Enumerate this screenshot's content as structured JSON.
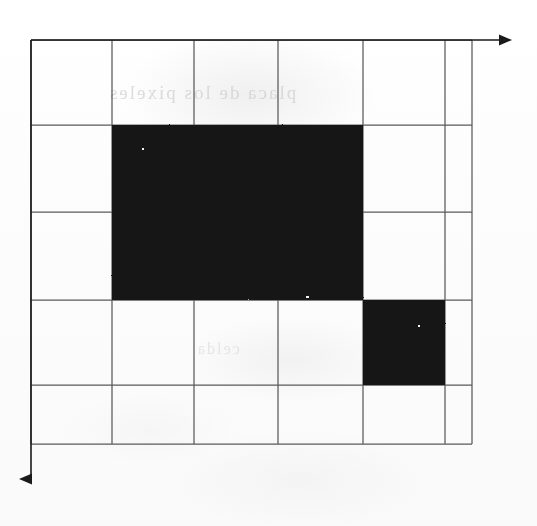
{
  "figure": {
    "title": "",
    "background_color": "#fdfdfd",
    "ink_color": "#111111",
    "grid_line_color": "#555555",
    "axis_color": "#1a1a1a"
  },
  "grid": {
    "columns": 6,
    "rows": 5,
    "x_lines": [
      31,
      112,
      194,
      278,
      363,
      445,
      472
    ],
    "y_lines": [
      40,
      125,
      212,
      300,
      385,
      444
    ],
    "cell_width": 82,
    "cell_height": 86,
    "last_column_narrow": true
  },
  "axes": {
    "x_axis": {
      "name": "horizontal-axis",
      "direction": "right",
      "start_x": 31,
      "end_x": 513,
      "y": 40,
      "arrowhead": true
    },
    "y_axis": {
      "name": "vertical-axis",
      "direction": "down",
      "x": 31,
      "start_y": 40,
      "end_y": 492,
      "arrowhead": true
    }
  },
  "shapes": [
    {
      "name": "large-filled-rectangle",
      "type": "rect",
      "fill": "#111111",
      "x": 112,
      "y": 125,
      "width": 251,
      "height": 175,
      "grid_span": {
        "col_start": 1,
        "col_end": 4,
        "row_start": 1,
        "row_end": 3
      },
      "cells_covered": 6
    },
    {
      "name": "small-filled-square",
      "type": "rect",
      "fill": "#111111",
      "x": 363,
      "y": 300,
      "width": 82,
      "height": 85,
      "grid_span": {
        "col_start": 4,
        "col_end": 5,
        "row_start": 3,
        "row_end": 4
      },
      "cells_covered": 1
    }
  ],
  "artifacts": {
    "ghost_text_upper": "placa de los pixeles",
    "ghost_text_lower": "celda",
    "note": "faint show-through from reverse side of scanned page"
  }
}
